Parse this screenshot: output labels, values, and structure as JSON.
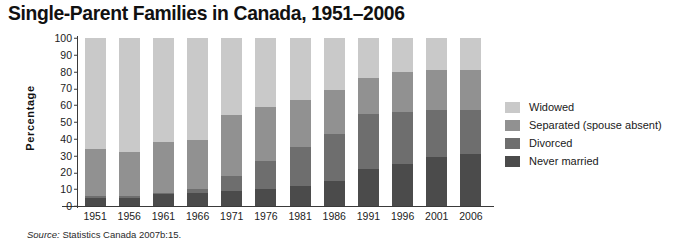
{
  "title": "Single-Parent Families in Canada, 1951–2006",
  "source": {
    "label": "Source:",
    "text": " Statistics Canada 2007b:15."
  },
  "axes": {
    "ylabel": "Percentage",
    "yticks": [
      0,
      10,
      20,
      30,
      40,
      50,
      60,
      70,
      80,
      90,
      100
    ],
    "ylim": [
      0,
      100
    ]
  },
  "legend": {
    "position": "right",
    "entries": [
      {
        "label": "Widowed",
        "color": "#c9c9c9"
      },
      {
        "label": "Separated (spouse absent)",
        "color": "#919191"
      },
      {
        "label": "Divorced",
        "color": "#6e6e6e"
      },
      {
        "label": "Never married",
        "color": "#4b4b4b"
      }
    ]
  },
  "chart_data": {
    "type": "bar",
    "stacked": true,
    "orientation": "vertical",
    "title": "Single-Parent Families in Canada, 1951–2006",
    "xlabel": "",
    "ylabel": "Percentage",
    "ylim": [
      0,
      100
    ],
    "grid": false,
    "categories": [
      "1951",
      "1956",
      "1961",
      "1966",
      "1971",
      "1976",
      "1981",
      "1986",
      "1991",
      "1996",
      "2001",
      "2006"
    ],
    "series": [
      {
        "name": "Never married",
        "color": "#4b4b4b",
        "values": [
          5,
          5,
          7,
          8,
          9,
          10,
          12,
          15,
          22,
          25,
          29,
          31
        ]
      },
      {
        "name": "Divorced",
        "color": "#6e6e6e",
        "values": [
          1,
          1,
          1,
          2,
          9,
          17,
          23,
          28,
          33,
          31,
          28,
          26
        ]
      },
      {
        "name": "Separated (spouse absent)",
        "color": "#919191",
        "values": [
          28,
          26,
          30,
          29,
          36,
          32,
          28,
          26,
          21,
          24,
          24,
          24
        ]
      },
      {
        "name": "Widowed",
        "color": "#c9c9c9",
        "values": [
          66,
          68,
          62,
          61,
          46,
          41,
          37,
          31,
          24,
          20,
          19,
          19
        ]
      }
    ]
  }
}
